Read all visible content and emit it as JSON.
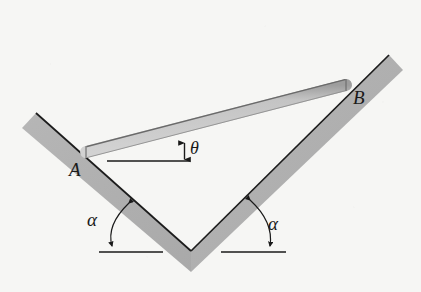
{
  "figure": {
    "type": "physics-mechanics-diagram",
    "background_color": "#f6f6f4",
    "colors": {
      "groove_fill": "#b2b2b2",
      "groove_edge": "#1e1e1e",
      "rod_fill": "#c9c9c9",
      "rod_edge": "#565656",
      "line_color": "#1a1a1a",
      "label_color": "#1a1a1a"
    },
    "labels": {
      "point_a": "A",
      "point_b": "B",
      "theta": "θ",
      "alpha_left": "α",
      "alpha_right": "α"
    },
    "annotations": {
      "theta_meaning": "inclination of rod AB above the horizontal reference line",
      "alpha_meaning": "inclination of each groove face above the horizontal"
    },
    "geometry": {
      "groove_vertex": [
        191,
        251
      ],
      "groove_left_tip": [
        36,
        113
      ],
      "groove_right_tip": [
        389,
        55
      ],
      "rod_end_a": [
        86,
        152
      ],
      "rod_end_b": [
        346,
        85
      ],
      "groove_thickness_px": 17,
      "rod_thickness_px": 11,
      "horizontal_reference_theta": {
        "x1": 107,
        "x2": 190,
        "y": 161
      },
      "horizontal_reference_alpha_left": {
        "x1": 99,
        "x2": 163,
        "y": 252
      },
      "horizontal_reference_alpha_right": {
        "x1": 221,
        "x2": 286,
        "y": 252
      }
    }
  }
}
